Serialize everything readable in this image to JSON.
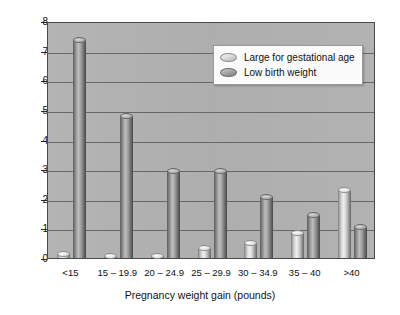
{
  "chart_data": {
    "type": "bar",
    "title": "",
    "xlabel": "Pregnancy weight gain (pounds)",
    "ylabel": "Percent incidence",
    "categories": [
      "<15",
      "15 – 19.9",
      "20 – 24.9",
      "25 – 29.9",
      "30 – 34.9",
      "35 – 40",
      ">40"
    ],
    "series": [
      {
        "name": "Large for gestational age",
        "values": [
          0.25,
          0.15,
          0.15,
          0.45,
          0.6,
          0.95,
          2.4
        ]
      },
      {
        "name": "Low birth weight",
        "values": [
          7.45,
          4.9,
          3.05,
          3.05,
          2.15,
          1.55,
          1.15
        ]
      }
    ],
    "ylim": [
      0,
      8
    ],
    "yticks": [
      0,
      1,
      2,
      3,
      4,
      5,
      6,
      7,
      8
    ],
    "ytick_labels": [
      "0",
      "1",
      "2",
      "3",
      "4",
      "5",
      "6",
      "7",
      "8"
    ],
    "grid": true,
    "legend_position": "upper right",
    "plot_background": "#b0b0b0",
    "series_colors": [
      "#e2e2e2",
      "#9a9a9a"
    ]
  },
  "legend": {
    "items": [
      {
        "label": "Large for gestational age"
      },
      {
        "label": "Low birth weight"
      }
    ]
  }
}
